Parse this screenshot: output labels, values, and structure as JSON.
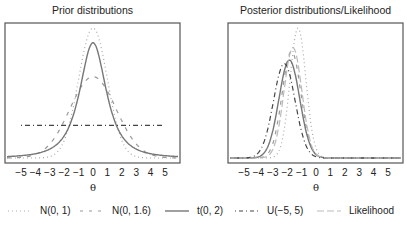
{
  "chart_data": [
    {
      "type": "line",
      "title": "Prior distributions",
      "xlabel": "θ",
      "ylabel": "",
      "xticks": [
        -5,
        -4,
        -3,
        -2,
        -1,
        0,
        1,
        2,
        3,
        4,
        5
      ],
      "xlim": [
        -6.1,
        6.1
      ],
      "series": [
        {
          "name": "N(0, 1)",
          "style": "dotted",
          "color": "#aaaaaa",
          "dist": "normal",
          "mean": 0,
          "sd": 1
        },
        {
          "name": "N(0, 1.6)",
          "style": "dashed",
          "color": "#999999",
          "dist": "normal",
          "mean": 0,
          "sd": 1.6
        },
        {
          "name": "t(0, 2)",
          "style": "solid",
          "color": "#777777",
          "dist": "t",
          "location": 0,
          "df": 2
        },
        {
          "name": "U(−5, 5)",
          "style": "dashdot",
          "color": "#444444",
          "dist": "uniform",
          "min": -5,
          "max": 5
        }
      ]
    },
    {
      "type": "line",
      "title": "Posterior distributions/Likelihood",
      "xlabel": "θ",
      "ylabel": "",
      "xticks": [
        -5,
        -4,
        -3,
        -2,
        -1,
        0,
        1,
        2,
        3,
        4,
        5
      ],
      "xlim": [
        -6.1,
        6.1
      ],
      "series": [
        {
          "name": "N(0, 1)",
          "style": "dotted",
          "color": "#aaaaaa",
          "mean": -1.25,
          "sd": 0.55,
          "peak": 0.73
        },
        {
          "name": "N(0, 1.6)",
          "style": "dashed",
          "color": "#999999",
          "mean": -1.7,
          "sd": 0.65,
          "peak": 0.6
        },
        {
          "name": "t(0, 2)",
          "style": "solid",
          "color": "#777777",
          "mean": -1.85,
          "sd": 0.72,
          "peak": 0.55
        },
        {
          "name": "U(−5, 5)",
          "style": "dashdot",
          "color": "#444444",
          "mean": -2.2,
          "sd": 0.75,
          "peak": 0.53
        },
        {
          "name": "Likelihood",
          "style": "longdash",
          "color": "#bbbbbb",
          "mean": -1.6,
          "sd": 0.62,
          "peak": 0.62
        }
      ]
    }
  ],
  "panels": {
    "left": {
      "title": "Prior distributions",
      "xlabel": "θ"
    },
    "right": {
      "title": "Posterior distributions/Likelihood",
      "xlabel": "θ"
    }
  },
  "ticks": [
    "−5",
    "−4",
    "−3",
    "−2",
    "−1",
    "0",
    "1",
    "2",
    "3",
    "4",
    "5"
  ],
  "legend": [
    {
      "label": "N(0, 1)",
      "style": "dotted"
    },
    {
      "label": "N(0, 1.6)",
      "style": "dashed"
    },
    {
      "label": "t(0, 2)",
      "style": "solid"
    },
    {
      "label": "U(−5, 5)",
      "style": "dashdot"
    },
    {
      "label": "Likelihood",
      "style": "longdash"
    }
  ]
}
